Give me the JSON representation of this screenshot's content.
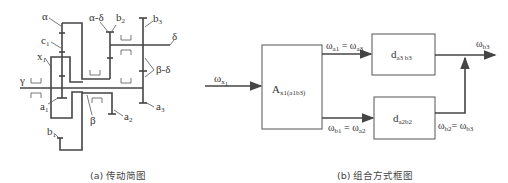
{
  "figure_a": {
    "caption": "(a) 传动简图",
    "labels": {
      "alpha": "α",
      "alpha_delta": "α-δ",
      "b2": "b",
      "b2_sub": "2",
      "b3": "b",
      "b3_sub": "3",
      "delta": "δ",
      "c1": "c",
      "c1_sub": "1",
      "x1": "x",
      "x1_sub": "1",
      "gamma": "γ",
      "beta_delta": "β-δ",
      "a1": "a",
      "a1_sub": "1",
      "beta": "β",
      "a2": "a",
      "a2_sub": "2",
      "a3": "a",
      "a3_sub": "3",
      "b1": "b",
      "b1_sub": "1"
    }
  },
  "figure_b": {
    "caption": "(b) 组合方式框图",
    "input": {
      "symbol": "ω",
      "sub": "x",
      "subsub": "1"
    },
    "block_A": {
      "symbol": "A",
      "sub": "x1(a1b3)"
    },
    "block_top": {
      "symbol": "d",
      "sub": "a3 b3"
    },
    "block_bottom": {
      "symbol": "d",
      "sub": "a2b2"
    },
    "top_link": {
      "left": "ω",
      "left_sub": "a1",
      "eq": " = ",
      "right": "ω",
      "right_sub": "a3"
    },
    "bottom_link": {
      "left": "ω",
      "left_sub": "b1",
      "eq": " = ",
      "right": "ω",
      "right_sub": "a2"
    },
    "return_link": {
      "left": "ω",
      "left_sub": "b2",
      "eq": "= ",
      "right": "ω",
      "right_sub": "b3"
    },
    "output": {
      "symbol": "ω",
      "sub": "b3"
    }
  }
}
